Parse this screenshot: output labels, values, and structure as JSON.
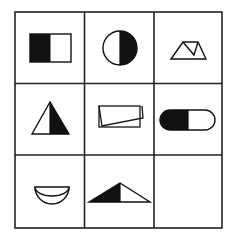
{
  "puzzle": {
    "type": "3x3 figure-reasoning matrix",
    "colors": {
      "ink": "#111111",
      "paper": "#ffffff",
      "grid": "#222222"
    },
    "grid": {
      "rows": 3,
      "cols": 3,
      "x_lines": [
        15,
        84.5,
        154,
        222
      ],
      "y_lines": [
        12,
        83.5,
        155,
        228
      ]
    },
    "cells": [
      {
        "row": 0,
        "col": 0,
        "figure": "square-left-half-black",
        "description": "Rectangle split vertically, left half filled black, right half white"
      },
      {
        "row": 0,
        "col": 1,
        "figure": "circle-right-half-black",
        "description": "Circle split vertically, right half filled black"
      },
      {
        "row": 0,
        "col": 2,
        "figure": "trapezoid-with-inner-lines",
        "description": "Outlined trapezoid with a folded inner line (no fill)"
      },
      {
        "row": 1,
        "col": 0,
        "figure": "triangle-right-half-black",
        "description": "Triangle split vertically, right half filled black"
      },
      {
        "row": 1,
        "col": 1,
        "figure": "folded-rectangle",
        "description": "Outlined rectangle with a folded overlapping flap (no fill)"
      },
      {
        "row": 1,
        "col": 2,
        "figure": "capsule-left-half-black",
        "description": "Capsule/pill split vertically, left half filled black"
      },
      {
        "row": 2,
        "col": 0,
        "figure": "semicircle-bowl",
        "description": "Outlined bowl shape: semicircle with inner arc (no fill)"
      },
      {
        "row": 2,
        "col": 1,
        "figure": "triangle-left-part-black",
        "description": "Obtuse triangle split vertically at apex, left part filled black"
      },
      {
        "row": 2,
        "col": 2,
        "figure": "empty",
        "description": "Blank cell (answer to be determined)"
      }
    ]
  }
}
